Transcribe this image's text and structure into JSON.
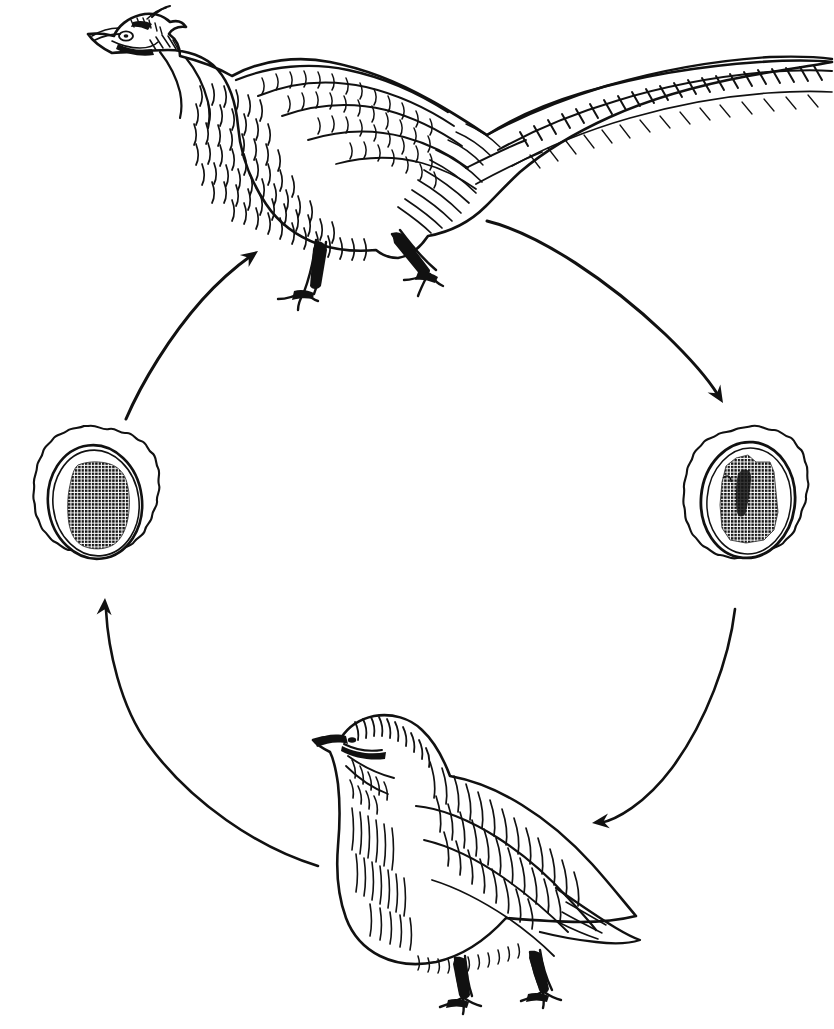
{
  "figure": {
    "type": "scientific line-drawing cycle diagram",
    "background_color": "#ffffff",
    "ink_color": "#111111",
    "width": 834,
    "height": 1029,
    "caption": "",
    "cycle_direction": "clockwise",
    "node_count": 4,
    "arrow_count": 4
  },
  "nodes": [
    {
      "id": "pheasant",
      "name": "ring-necked-pheasant",
      "label": "Ring-necked pheasant",
      "position": "top",
      "center": [
        380,
        150
      ],
      "bbox": [
        62,
        10,
        834,
        300
      ],
      "facing": "left",
      "style": "pen-and-ink hatched engraving",
      "features": [
        "long barred tail",
        "white neck ring",
        "erect head",
        "walking pose",
        "scaled breast feathers"
      ]
    },
    {
      "id": "cell-right",
      "name": "cell-stage-right",
      "label": "Cell / oocyst stage",
      "position": "right",
      "center": [
        750,
        500
      ],
      "bbox": [
        678,
        424,
        822,
        582
      ],
      "features": [
        "crenulated outer wall",
        "smooth inner membrane ring",
        "dense stippled nucleus"
      ],
      "nucleus_shape": "blocky rectangular mass",
      "nucleus_fill": "cross-hatch stipple"
    },
    {
      "id": "quail",
      "name": "quail",
      "label": "Quail",
      "position": "bottom",
      "center": [
        470,
        860
      ],
      "bbox": [
        312,
        712,
        640,
        1018
      ],
      "facing": "left",
      "style": "pen-and-ink hatched engraving",
      "features": [
        "short pointed tail",
        "striped crown and cheek",
        "plump body",
        "streaked flanks",
        "standing pose"
      ]
    },
    {
      "id": "cell-left",
      "name": "cell-stage-left",
      "label": "Cell / oocyst stage",
      "position": "left",
      "center": [
        88,
        500
      ],
      "bbox": [
        16,
        424,
        162,
        582
      ],
      "features": [
        "crenulated outer wall",
        "smooth inner membrane ring",
        "dense stippled nucleus"
      ],
      "nucleus_shape": "rounded blob mass",
      "nucleus_fill": "cross-hatch stipple"
    }
  ],
  "arrows": [
    {
      "id": "arrow-cellleft-to-pheasant",
      "name": "arrow-left-cell-to-pheasant",
      "from": "cell-left",
      "to": "pheasant",
      "direction": "up-right",
      "head_at": [
        256,
        252
      ],
      "tail_at": [
        126,
        418
      ]
    },
    {
      "id": "arrow-pheasant-to-cellright",
      "name": "arrow-pheasant-to-right-cell",
      "from": "pheasant",
      "to": "cell-right",
      "direction": "down-right",
      "head_at": [
        720,
        402
      ],
      "tail_at": [
        487,
        221
      ]
    },
    {
      "id": "arrow-cellright-to-quail",
      "name": "arrow-right-cell-to-quail",
      "from": "cell-right",
      "to": "quail",
      "direction": "down-left",
      "head_at": [
        592,
        822
      ],
      "tail_at": [
        735,
        608
      ]
    },
    {
      "id": "arrow-quail-to-cellleft",
      "name": "arrow-quail-to-left-cell",
      "from": "quail",
      "to": "cell-left",
      "direction": "up-left",
      "head_at": [
        105,
        597
      ],
      "tail_at": [
        318,
        866
      ]
    }
  ]
}
